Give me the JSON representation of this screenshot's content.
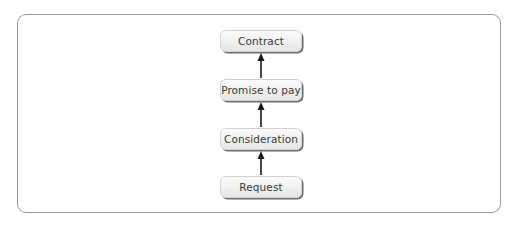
{
  "diagram": {
    "type": "flow",
    "direction": "bottom-to-top",
    "nodes": [
      {
        "id": "contract",
        "label": "Contract"
      },
      {
        "id": "promise",
        "label": "Promise to pay"
      },
      {
        "id": "consideration",
        "label": "Consideration"
      },
      {
        "id": "request",
        "label": "Request"
      }
    ],
    "edges": [
      {
        "from": "request",
        "to": "consideration"
      },
      {
        "from": "consideration",
        "to": "promise"
      },
      {
        "from": "promise",
        "to": "contract"
      }
    ],
    "colors": {
      "frame": "#9a9a9a",
      "box_fill_top": "#fbfbfb",
      "box_fill_bottom": "#e6e6e6",
      "box_shadow": "#6e6e6e",
      "text": "#3a3a3a",
      "arrow": "#1a1a1a"
    }
  }
}
